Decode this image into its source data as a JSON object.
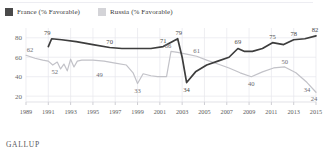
{
  "footer": {
    "source": "GALLUP"
  },
  "legend": {
    "items": [
      {
        "label": "France (% Favorable)",
        "color": "#4a4a4a",
        "key": "france"
      },
      {
        "label": "Russia (% Favorable)",
        "color": "#d4d4d8",
        "key": "russia"
      }
    ]
  },
  "chart_data": {
    "type": "line",
    "title": "",
    "xlabel": "",
    "ylabel": "",
    "xlim": [
      1989,
      2015
    ],
    "ylim": [
      14,
      88
    ],
    "grid": true,
    "legend_position": "top-left",
    "ytick_labels": [
      "20",
      "40",
      "60",
      "80"
    ],
    "ytick_values": [
      20,
      40,
      60,
      80
    ],
    "xtick_labels": [
      "1989",
      "1991",
      "1993",
      "1995",
      "1997",
      "1999",
      "2001",
      "2003",
      "2005",
      "2007",
      "2009",
      "2011",
      "2013",
      "2015"
    ],
    "xtick_values": [
      1989,
      1991,
      1993,
      1995,
      1997,
      1999,
      2001,
      2003,
      2005,
      2007,
      2009,
      2011,
      2013,
      2015
    ],
    "series": [
      {
        "name": "France (% Favorable)",
        "color": "#3d3d3d",
        "x": [
          1991.0,
          1991.3,
          1992.2,
          1993.5,
          1995.0,
          1996.5,
          1997.6,
          1999.0,
          2000.2,
          2001.3,
          2002.1,
          2002.6,
          2003.0,
          2003.4,
          2004.2,
          2005.2,
          2006.2,
          2007.2,
          2008.0,
          2008.6,
          2009.3,
          2010.2,
          2011.1,
          2012.1,
          2013.0,
          2014.0,
          2015.0
        ],
        "values": [
          71,
          79,
          78,
          76,
          73,
          70,
          69,
          69,
          69,
          71,
          76,
          79,
          60,
          34,
          45,
          52,
          56,
          60,
          69,
          66,
          66,
          69,
          75,
          73,
          78,
          79,
          82
        ]
      },
      {
        "name": "Russia (% Favorable)",
        "color": "#c2c2c8",
        "x": [
          1989.0,
          1989.8,
          1990.5,
          1991.0,
          1991.4,
          1991.8,
          1992.1,
          1992.4,
          1992.7,
          1993.0,
          1993.3,
          1993.6,
          1994.0,
          1995.0,
          1996.0,
          1997.0,
          1998.0,
          1998.6,
          1999.0,
          1999.5,
          2000.2,
          2000.8,
          2001.2,
          2001.6,
          2002.0,
          2002.6,
          2003.5,
          2004.3,
          2005.2,
          2006.2,
          2007.2,
          2008.2,
          2009.2,
          2010.2,
          2011.2,
          2012.2,
          2013.2,
          2014.2,
          2015.0
        ],
        "values": [
          62,
          59,
          57,
          56,
          52,
          55,
          48,
          53,
          46,
          58,
          50,
          56,
          57,
          57,
          56,
          54,
          52,
          44,
          33,
          43,
          41,
          40,
          40,
          40,
          66,
          65,
          63,
          61,
          57,
          53,
          49,
          44,
          40,
          45,
          49,
          50,
          44,
          34,
          24
        ]
      }
    ],
    "point_labels": [
      {
        "series": "france",
        "year": 1991,
        "value": 79,
        "text": "79"
      },
      {
        "series": "france",
        "year": 1996.5,
        "value": 70,
        "text": "70"
      },
      {
        "series": "france",
        "year": 2001.3,
        "value": 71,
        "text": "71"
      },
      {
        "series": "france",
        "year": 2002.6,
        "value": 79,
        "text": "79"
      },
      {
        "series": "france",
        "year": 2003.4,
        "value": 34,
        "text": "34"
      },
      {
        "series": "france",
        "year": 2008.0,
        "value": 69,
        "text": "69"
      },
      {
        "series": "france",
        "year": 2011.1,
        "value": 75,
        "text": "75"
      },
      {
        "series": "france",
        "year": 2013.0,
        "value": 78,
        "text": "78"
      },
      {
        "series": "france",
        "year": 2015.0,
        "value": 82,
        "text": "82"
      },
      {
        "series": "russia",
        "year": 1989.0,
        "value": 62,
        "text": "62"
      },
      {
        "series": "russia",
        "year": 1991.4,
        "value": 52,
        "text": "52"
      },
      {
        "series": "russia",
        "year": 1995.6,
        "value": 49,
        "text": "49"
      },
      {
        "series": "russia",
        "year": 1999.0,
        "value": 33,
        "text": "33"
      },
      {
        "series": "russia",
        "year": 2002.0,
        "value": 66,
        "text": "66"
      },
      {
        "series": "russia",
        "year": 2004.3,
        "value": 61,
        "text": "61"
      },
      {
        "series": "russia",
        "year": 2009.2,
        "value": 40,
        "text": "40"
      },
      {
        "series": "russia",
        "year": 2012.2,
        "value": 50,
        "text": "50"
      },
      {
        "series": "russia",
        "year": 2014.2,
        "value": 34,
        "text": "34"
      },
      {
        "series": "russia",
        "year": 2015.0,
        "value": 24,
        "text": "24"
      }
    ]
  }
}
